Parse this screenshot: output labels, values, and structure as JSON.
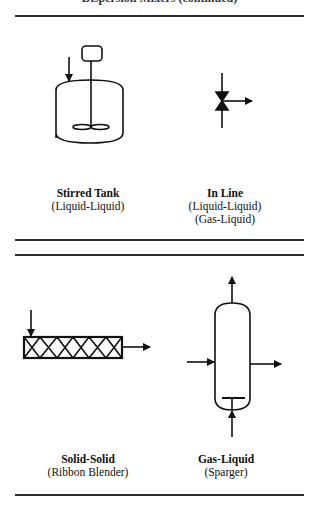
{
  "page": {
    "top_title_partial": "Dispersion Mixers (continued)"
  },
  "sections": [
    {
      "items": [
        {
          "name": "Stirred Tank",
          "sub": [
            "(Liquid-Liquid)"
          ]
        },
        {
          "name": "In Line",
          "sub": [
            "(Liquid-Liquid)",
            "(Gas-Liquid)"
          ]
        }
      ]
    },
    {
      "items": [
        {
          "name": "Solid-Solid",
          "sub": [
            "(Ribbon Blender)"
          ]
        },
        {
          "name": "Gas-Liquid",
          "sub": [
            "(Sparger)"
          ]
        }
      ]
    }
  ],
  "colors": {
    "ink": "#111111",
    "rule": "#2a2a2a",
    "background": "#ffffff"
  }
}
